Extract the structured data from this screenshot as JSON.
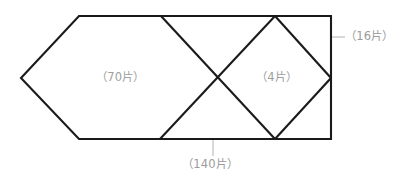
{
  "figure": {
    "title": "",
    "background_color": "#ffffff",
    "stroke_color": "#1a1a1a",
    "label_color": "#9b9b9b",
    "leader_color": "#b9b9b9"
  },
  "labels": {
    "hexagon_region": "（70片）",
    "diamond_region": "（4片）",
    "right_edge": "（16片）",
    "bottom_edge": "（140片）"
  },
  "geometry": {
    "type": "composite-polygon-diagram",
    "outline": {
      "name": "hexagon-plus-rectangle-outline",
      "points": "79,16 331,16 331,139 79,139 21,78"
    },
    "paths": [
      {
        "name": "hexagon-left-upper-edge",
        "points": "79,16 21,78"
      },
      {
        "name": "hexagon-left-lower-edge",
        "points": "21,78 79,139"
      },
      {
        "name": "top-edge",
        "points": "79,16 331,16"
      },
      {
        "name": "bottom-edge",
        "points": "79,139 331,139"
      },
      {
        "name": "right-edge",
        "points": "331,16 331,139"
      },
      {
        "name": "x-cross-down-right",
        "points": "161,16 275,139"
      },
      {
        "name": "x-cross-up-right",
        "points": "160,139 275,16"
      },
      {
        "name": "diamond-upper-right-edge",
        "points": "275,16 331,78"
      },
      {
        "name": "diamond-lower-right-edge",
        "points": "331,78 275,139"
      }
    ],
    "vertices": {
      "hexagon_left_apex": [
        21,
        78
      ],
      "hexagon_top_left": [
        79,
        16
      ],
      "hexagon_top_right": [
        161,
        16
      ],
      "hexagon_bottom_left": [
        79,
        139
      ],
      "hexagon_bottom_right": [
        160,
        139
      ],
      "x_crossing": [
        217,
        78
      ],
      "diamond_top": [
        275,
        16
      ],
      "diamond_right": [
        331,
        78
      ],
      "diamond_bottom": [
        275,
        139
      ],
      "rect_top_right": [
        331,
        16
      ],
      "rect_bottom_right": [
        331,
        139
      ]
    },
    "leaders": [
      {
        "name": "right-edge-leader",
        "points": "332,37 345,37"
      },
      {
        "name": "bottom-edge-leader",
        "points": "213,140 213,156"
      }
    ]
  }
}
